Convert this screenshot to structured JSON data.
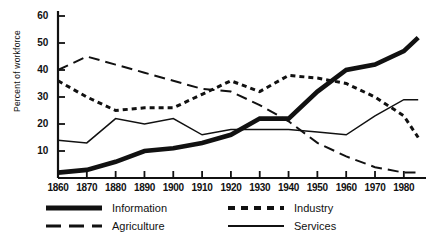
{
  "chart_data": {
    "type": "line",
    "title": "",
    "xlabel": "",
    "ylabel": "Percent of workforce",
    "xlim": [
      1860,
      1987
    ],
    "ylim": [
      0,
      60
    ],
    "grid": false,
    "legend_position": "bottom",
    "x": [
      1860,
      1870,
      1880,
      1890,
      1900,
      1910,
      1920,
      1930,
      1940,
      1950,
      1960,
      1970,
      1980,
      1985
    ],
    "xticks": [
      1860,
      1870,
      1880,
      1890,
      1900,
      1910,
      1920,
      1930,
      1940,
      1950,
      1960,
      1970,
      1980
    ],
    "yticks": [
      10,
      20,
      30,
      40,
      50,
      60
    ],
    "series": [
      {
        "name": "Information",
        "style": "thick-solid",
        "values": [
          2,
          3,
          6,
          10,
          11,
          13,
          16,
          22,
          22,
          32,
          40,
          42,
          47,
          52
        ]
      },
      {
        "name": "Agriculture",
        "style": "long-dash",
        "values": [
          40,
          45,
          42,
          39,
          36,
          33,
          32,
          27,
          21,
          13,
          8,
          4,
          2,
          2
        ]
      },
      {
        "name": "Industry",
        "style": "short-dash",
        "values": [
          36,
          30,
          25,
          26,
          26,
          31,
          36,
          32,
          38,
          37,
          35,
          30,
          23,
          15
        ]
      },
      {
        "name": "Services",
        "style": "thin-solid",
        "values": [
          14,
          13,
          22,
          20,
          22,
          16,
          18,
          18,
          18,
          17,
          16,
          23,
          29,
          29
        ]
      }
    ]
  },
  "legend": {
    "entries": [
      {
        "label": "Information",
        "swatch": "thick-solid-swatch"
      },
      {
        "label": "Agriculture",
        "swatch": "long-dash-swatch"
      },
      {
        "label": "Industry",
        "swatch": "short-dash-swatch"
      },
      {
        "label": "Services",
        "swatch": "thin-solid-swatch"
      }
    ]
  },
  "colors": {
    "ink": "#111111",
    "background": "#ffffff"
  }
}
